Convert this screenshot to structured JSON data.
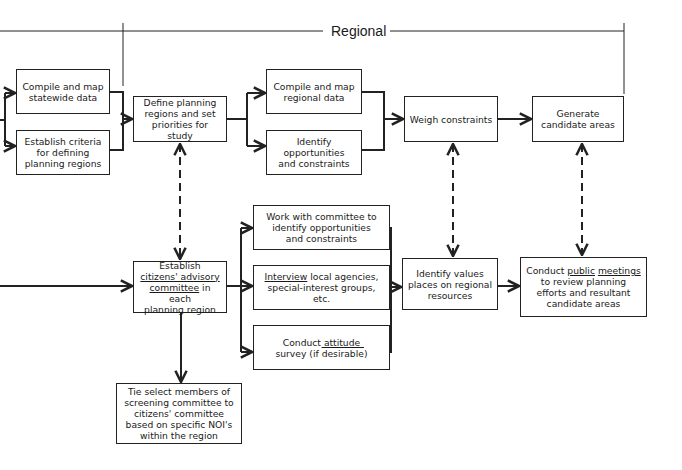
{
  "header": {
    "title": "Regional"
  },
  "nodes": {
    "compile_statewide": {
      "lines": [
        "Compile and map",
        "statewide data"
      ]
    },
    "establish_criteria": {
      "lines": [
        "Establish criteria",
        "for defining",
        "planning regions"
      ]
    },
    "define_regions": {
      "lines": [
        "Define planning",
        "regions and set",
        "priorities for study"
      ]
    },
    "compile_regional": {
      "lines": [
        "Compile and map",
        "regional data"
      ]
    },
    "identify_opportunities": {
      "lines": [
        "Identify",
        "opportunities",
        "and constraints"
      ]
    },
    "weigh_constraints": {
      "lines": [
        "Weigh constraints"
      ]
    },
    "generate_candidates": {
      "lines": [
        "Generate",
        "candidate areas"
      ]
    },
    "establish_committee": {
      "l1": "Establish",
      "l2": "citizens' advisory",
      "l3a": "committee",
      "l3b": " in each",
      "l4": "planning region"
    },
    "work_with_committee": {
      "lines": [
        "Work with committee to",
        "identify opportunities",
        "and constraints"
      ]
    },
    "interview": {
      "l1a": "Interview",
      "l1b": " local agencies,",
      "l2": "special-interest groups,",
      "l3": "etc."
    },
    "attitude_survey": {
      "l1a": "Conduct ",
      "l1b": "attitude",
      "l2a": "survey (if ",
      "l2b": "desirable",
      "l2c": ")"
    },
    "identify_values": {
      "lines": [
        "Identify values",
        "places on regional",
        "resources"
      ]
    },
    "public_meetings": {
      "l1a": "Conduct ",
      "l1b": "public",
      "l1c": " ",
      "l1d": "meetings",
      "l2": "to review planning",
      "l3": "efforts and resultant",
      "l4": "candidate areas"
    },
    "tie_members": {
      "lines": [
        "Tie select members of",
        "screening committee to",
        "citizens' committee",
        "based on specific NOI's",
        "within the region"
      ]
    }
  }
}
